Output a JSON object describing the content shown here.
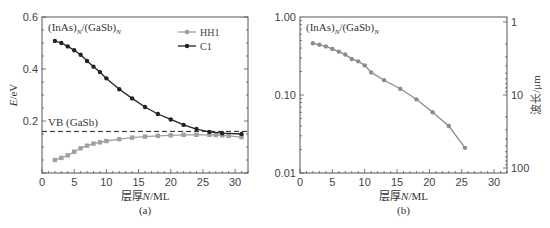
{
  "chart_data": [
    {
      "id": "a",
      "type": "line",
      "caption": "(a)",
      "annotation": "(InAs)N/(GaSb)N",
      "xlabel": "层厚N/ML",
      "ylabel": "E/eV",
      "xlim": [
        0,
        32
      ],
      "ylim": [
        0,
        0.6
      ],
      "xticks": [
        0,
        5,
        10,
        15,
        20,
        25,
        30
      ],
      "yticks": [
        0.2,
        0.4,
        0.6
      ],
      "ytick_labels": [
        "0.2",
        "0.4",
        "0.6"
      ],
      "grid": false,
      "legend_position": "upper right",
      "reference_line": {
        "label": "VB (GaSb)",
        "y": 0.16,
        "style": "dashed"
      },
      "series": [
        {
          "name": "HH1",
          "color": "#a0a0a0",
          "marker": "square",
          "x": [
            2,
            3,
            4,
            5,
            6,
            7,
            8,
            9,
            10,
            12,
            14,
            16,
            18,
            20,
            22,
            24,
            26,
            27,
            28,
            29,
            31
          ],
          "values": [
            0.05,
            0.058,
            0.068,
            0.082,
            0.095,
            0.105,
            0.113,
            0.118,
            0.123,
            0.13,
            0.136,
            0.14,
            0.143,
            0.145,
            0.147,
            0.147,
            0.147,
            0.146,
            0.145,
            0.143,
            0.138
          ]
        },
        {
          "name": "C1",
          "color": "#222222",
          "marker": "circle",
          "x": [
            2,
            3,
            4,
            5,
            6,
            7,
            8,
            9,
            10,
            12,
            14,
            16,
            18,
            20,
            22,
            24,
            26,
            28,
            31
          ],
          "values": [
            0.508,
            0.5,
            0.487,
            0.472,
            0.455,
            0.431,
            0.409,
            0.388,
            0.364,
            0.322,
            0.287,
            0.254,
            0.227,
            0.206,
            0.185,
            0.169,
            0.158,
            0.153,
            0.15
          ]
        }
      ]
    },
    {
      "id": "b",
      "type": "line",
      "caption": "(b)",
      "annotation": "(InAs)N/(GaSb)N",
      "xlabel": "层厚N/ML",
      "ylabel": "Eg/eV",
      "ylabel_right": "波长/μm",
      "yscale": "log",
      "xlim": [
        0,
        32
      ],
      "ylim": [
        0.01,
        1.0
      ],
      "xticks": [
        0,
        5,
        10,
        15,
        20,
        25,
        30
      ],
      "yticks": [
        0.01,
        0.1,
        1.0
      ],
      "ytick_labels": [
        "0.01",
        "0.10",
        "1.00"
      ],
      "right_ticks": [
        1,
        10,
        100
      ],
      "right_tick_labels": [
        "1",
        "10",
        "100"
      ],
      "grid": false,
      "series": [
        {
          "name": "Eg",
          "color": "#8c8c8c",
          "marker": "circle",
          "x": [
            2,
            3,
            4,
            5,
            6,
            7,
            8,
            9,
            10,
            11,
            13,
            15,
            17,
            19,
            21,
            23,
            25,
            27,
            29,
            31
          ],
          "values": [
            0.46,
            0.44,
            0.42,
            0.39,
            0.36,
            0.33,
            0.29,
            0.27,
            0.24,
            0.195,
            0.155,
            0.12,
            0.088,
            0.06,
            0.04,
            0.021
          ]
        }
      ]
    }
  ],
  "labels": {
    "a_caption": "(a)",
    "b_caption": "(b)",
    "xlabel": "层厚N/ML",
    "a_ylabel": "E/eV",
    "b_ylabel": "Eg/eV",
    "b_ylabel_right": "波长/μm",
    "legend_hh1": "HH1",
    "legend_c1": "C1",
    "vb_label": "VB (GaSb)"
  }
}
